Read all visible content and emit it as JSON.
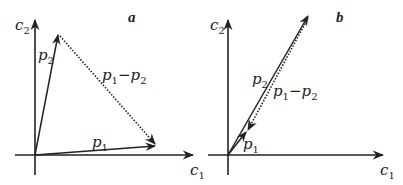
{
  "colors": {
    "ink": "#222222",
    "background": "#ffffff"
  },
  "panels": [
    {
      "tag": "a",
      "axes": {
        "x_label": "c",
        "x_sub": "1",
        "y_label": "c",
        "y_sub": "2"
      },
      "vectors": {
        "p1": {
          "label": "p",
          "sub": "1",
          "style": "solid"
        },
        "p2": {
          "label": "p",
          "sub": "2",
          "style": "solid"
        },
        "diff": {
          "label_a": "p",
          "sub_a": "1",
          "minus": "−",
          "label_b": "p",
          "sub_b": "2",
          "style": "dotted"
        }
      }
    },
    {
      "tag": "b",
      "axes": {
        "x_label": "c",
        "x_sub": "1",
        "y_label": "c",
        "y_sub": "2"
      },
      "vectors": {
        "p1": {
          "label": "p",
          "sub": "1",
          "style": "solid"
        },
        "p2": {
          "label": "p",
          "sub": "2",
          "style": "solid"
        },
        "diff": {
          "label_a": "p",
          "sub_a": "1",
          "minus": "−",
          "label_b": "p",
          "sub_b": "2",
          "style": "dotted"
        }
      }
    }
  ]
}
